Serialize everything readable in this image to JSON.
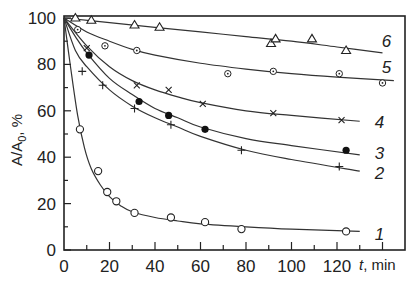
{
  "chart_data": {
    "type": "line",
    "title": "",
    "xlabel": "t, min",
    "ylabel": "A/A0, %",
    "xlim": [
      0,
      150
    ],
    "ylim": [
      0,
      100
    ],
    "x_ticks": [
      0,
      20,
      40,
      60,
      80,
      100,
      120
    ],
    "y_ticks": [
      0,
      20,
      40,
      60,
      80,
      100
    ],
    "grid": false,
    "legend": "inline curve numbers",
    "series": [
      {
        "name": "1",
        "marker": "open-circle",
        "x": [
          7,
          15,
          19,
          23,
          31,
          47,
          62,
          78,
          124
        ],
        "y": [
          52,
          34,
          25,
          21,
          16,
          14,
          12,
          9,
          8
        ],
        "curve": [
          [
            0,
            100
          ],
          [
            3,
            78
          ],
          [
            6,
            58
          ],
          [
            9,
            44
          ],
          [
            12,
            35
          ],
          [
            16,
            28
          ],
          [
            20,
            23
          ],
          [
            25,
            19
          ],
          [
            30,
            16.5
          ],
          [
            40,
            14
          ],
          [
            50,
            12.5
          ],
          [
            60,
            11.3
          ],
          [
            80,
            10
          ],
          [
            100,
            9
          ],
          [
            130,
            8
          ]
        ]
      },
      {
        "name": "2",
        "marker": "plus",
        "x": [
          8,
          17,
          31,
          47,
          78,
          121
        ],
        "y": [
          77,
          71,
          61,
          54,
          43,
          36
        ],
        "curve": [
          [
            0,
            100
          ],
          [
            5,
            86
          ],
          [
            10,
            79
          ],
          [
            20,
            69
          ],
          [
            30,
            62
          ],
          [
            40,
            57
          ],
          [
            50,
            53
          ],
          [
            60,
            49
          ],
          [
            80,
            43
          ],
          [
            100,
            39
          ],
          [
            130,
            34
          ]
        ]
      },
      {
        "name": "3",
        "marker": "filled-circle",
        "x": [
          11,
          33,
          46,
          62,
          124
        ],
        "y": [
          84,
          64,
          58,
          52,
          43
        ],
        "curve": [
          [
            0,
            100
          ],
          [
            5,
            92
          ],
          [
            10,
            85
          ],
          [
            20,
            74
          ],
          [
            30,
            67
          ],
          [
            40,
            61
          ],
          [
            50,
            57
          ],
          [
            60,
            53
          ],
          [
            80,
            48
          ],
          [
            100,
            45
          ],
          [
            130,
            41
          ]
        ]
      },
      {
        "name": "4",
        "marker": "x",
        "x": [
          10,
          32,
          46,
          61,
          92,
          122
        ],
        "y": [
          87,
          71,
          69,
          63,
          59,
          56
        ],
        "curve": [
          [
            0,
            100
          ],
          [
            10,
            88
          ],
          [
            20,
            79
          ],
          [
            30,
            73
          ],
          [
            40,
            69
          ],
          [
            50,
            66
          ],
          [
            60,
            63.5
          ],
          [
            80,
            60
          ],
          [
            100,
            58
          ],
          [
            130,
            55.5
          ]
        ]
      },
      {
        "name": "5",
        "marker": "dotted-circle",
        "x": [
          6,
          18,
          32,
          72,
          92,
          121,
          140
        ],
        "y": [
          95,
          88,
          86,
          76,
          77,
          76,
          72
        ],
        "curve": [
          [
            0,
            100
          ],
          [
            10,
            94
          ],
          [
            20,
            90
          ],
          [
            30,
            86.5
          ],
          [
            40,
            84
          ],
          [
            60,
            80.5
          ],
          [
            80,
            78
          ],
          [
            100,
            76
          ],
          [
            120,
            74.5
          ],
          [
            145,
            73
          ]
        ]
      },
      {
        "name": "6",
        "marker": "open-triangle",
        "x": [
          5,
          12,
          31,
          42,
          91,
          93,
          109,
          124
        ],
        "y": [
          100,
          99,
          97,
          96,
          89,
          91,
          91,
          86
        ],
        "curve": [
          [
            0,
            100
          ],
          [
            20,
            98
          ],
          [
            40,
            96
          ],
          [
            60,
            94
          ],
          [
            80,
            92
          ],
          [
            100,
            90
          ],
          [
            120,
            87.5
          ],
          [
            140,
            85
          ]
        ]
      }
    ],
    "curve_labels": {
      "1": "1",
      "2": "2",
      "3": "3",
      "4": "4",
      "5": "5",
      "6": "6"
    }
  },
  "axes": {
    "ylabel_main": "A/A",
    "ylabel_sub": "0",
    "ylabel_unit": ", %",
    "xlabel_var": "t",
    "xlabel_unit": ", min"
  }
}
